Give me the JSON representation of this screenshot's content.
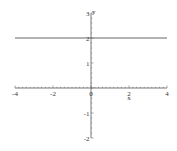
{
  "chart_data": {
    "type": "line",
    "title": "",
    "xlabel": "x",
    "ylabel": "y",
    "xlim": [
      -4,
      4
    ],
    "ylim": [
      -2,
      3
    ],
    "grid": false,
    "legend": null,
    "x_ticks": [
      -4,
      -2,
      0,
      2,
      4
    ],
    "x_tick_labels": [
      "-4",
      "-2",
      "0",
      "2",
      "4"
    ],
    "y_ticks": [
      -2,
      -1,
      1,
      2,
      3
    ],
    "y_tick_labels": [
      "-2",
      "-1",
      "1",
      "2",
      "3"
    ],
    "series": [
      {
        "name": "y = 2",
        "x": [
          -4,
          4
        ],
        "y": [
          2,
          2
        ],
        "color": "#555555"
      }
    ]
  },
  "colors": {
    "axis": "#555555",
    "line": "#555555"
  }
}
